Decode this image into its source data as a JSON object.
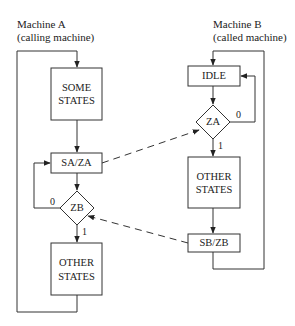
{
  "machine_a": {
    "title": "Machine A",
    "subtitle": "(calling machine)",
    "states": {
      "some_states_line1": "SOME",
      "some_states_line2": "STATES",
      "sa_za": "SA/ZA",
      "zb_decision": "ZB",
      "zb_false": "0",
      "zb_true": "1",
      "other_states_line1": "OTHER",
      "other_states_line2": "STATES"
    }
  },
  "machine_b": {
    "title": "Machine B",
    "subtitle": "(called machine)",
    "states": {
      "idle": "IDLE",
      "za_decision": "ZA",
      "za_false": "0",
      "za_true": "1",
      "other_states_line1": "OTHER",
      "other_states_line2": "STATES",
      "sb_zb": "SB/ZB"
    }
  },
  "signals": [
    {
      "from": "SA/ZA",
      "to": "ZA",
      "style": "dashed"
    },
    {
      "from": "SB/ZB",
      "to": "ZB",
      "style": "dashed"
    }
  ],
  "colors": {
    "line": "#333333",
    "background": "#ffffff"
  }
}
